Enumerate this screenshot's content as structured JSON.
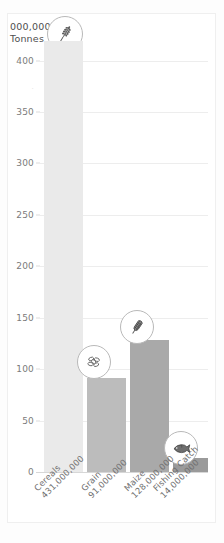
{
  "chart_data": {
    "type": "bar",
    "title": "",
    "subtitle": "",
    "xlabel": "",
    "ylabel": "000,000 Tonnes",
    "ylabel_line1": "000,000",
    "ylabel_line2": "Tonnes",
    "ylim": [
      0,
      431
    ],
    "yticks": [
      400,
      350,
      300,
      250,
      200,
      150,
      100,
      50,
      0
    ],
    "ytick_labels": [
      "400",
      "350",
      "300",
      "250",
      "200",
      "150",
      "100",
      "50",
      "0"
    ],
    "grid": true,
    "legend": "none",
    "categories": [
      "Cereals",
      "Grain",
      "Maize",
      "Fishing Catch"
    ],
    "values": [
      431,
      91,
      128,
      14
    ],
    "value_labels": [
      "431,000,000",
      "91,000,000",
      "128,000,000",
      "14,000,000"
    ],
    "bar_colors": [
      "#eaeaea",
      "#bcbcbc",
      "#a9a9a9",
      "#9a9a9a"
    ],
    "annotations": [
      {
        "icon": "wheat-ear-icon",
        "target": "y-axis-title"
      },
      {
        "icon": "grain-seeds-icon",
        "target": "Grain"
      },
      {
        "icon": "corn-cob-icon",
        "target": "Maize"
      },
      {
        "icon": "fish-icon",
        "target": "Fishing Catch"
      }
    ]
  },
  "axis": {
    "y_title_line1": "000,000",
    "y_title_line2": "Tonnes",
    "y_faint_tick": "."
  },
  "bars": [
    {
      "name": "Cereals",
      "number": "431,000,000",
      "value": 431
    },
    {
      "name": "Grain",
      "number": "91,000,000",
      "value": 91
    },
    {
      "name": "Maize",
      "number": "128,000,000",
      "value": 128
    },
    {
      "name": "Fishing Catch",
      "number": "14,000,000",
      "value": 14
    }
  ],
  "ticks": {
    "t400": "400",
    "t350": "350",
    "t300": "300",
    "t250": "250",
    "t200": "200",
    "t150": "150",
    "t100": "100",
    "t50": "50",
    "t0": "0"
  }
}
